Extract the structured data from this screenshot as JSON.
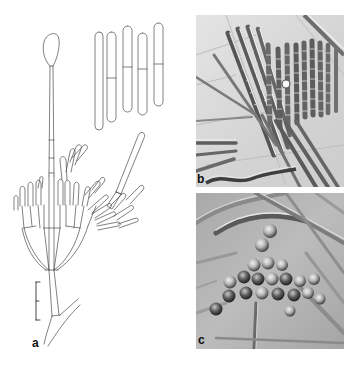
{
  "figure": {
    "panels": [
      {
        "id": "a",
        "label": "a",
        "type": "line-drawing",
        "content": "conidiophore with vesicle, penicillate branching, chains of cylindrical conidia, separate conidia with single septa",
        "scale_bar": true
      },
      {
        "id": "b",
        "label": "b",
        "type": "DIC micrograph",
        "content": "cylindrical conidia in parallel columns/chains"
      },
      {
        "id": "c",
        "label": "c",
        "type": "DIC micrograph",
        "content": "cluster of globose cells among hyphae"
      }
    ],
    "colors": {
      "background": "#ffffff",
      "line": "#4a4a4a",
      "photo_b_bg": "#d9d9d9",
      "photo_c_bg": "#b5b5b5"
    }
  }
}
